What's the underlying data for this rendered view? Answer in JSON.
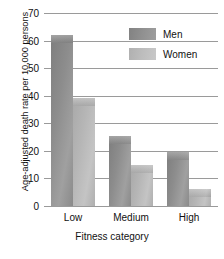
{
  "chart_data": {
    "type": "bar",
    "title": "",
    "subtitle": "",
    "xlabel": "Fitness category",
    "ylabel": "Age-adjusted death rate per 10,000 persons",
    "categories": [
      "Low",
      "Medium",
      "High"
    ],
    "series": [
      {
        "name": "Men",
        "color": "#8d8d8d",
        "values": [
          62,
          25.5,
          19.5
        ]
      },
      {
        "name": "Women",
        "color": "#bcbcbc",
        "values": [
          39,
          15,
          6
        ]
      }
    ],
    "ylim": [
      0,
      70
    ],
    "ytick_labels": [
      "0",
      "10",
      "20",
      "30",
      "40",
      "50",
      "60",
      "70"
    ],
    "ytick_values": [
      0,
      10,
      20,
      30,
      40,
      50,
      60,
      70
    ],
    "grid": true,
    "legend_position": "top-right"
  },
  "legend": {
    "entries": [
      {
        "label": "Men",
        "swatch": "men-swatch"
      },
      {
        "label": "Women",
        "swatch": "women-swatch"
      }
    ]
  }
}
